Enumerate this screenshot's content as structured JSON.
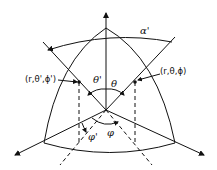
{
  "diagram": {
    "type": "spherical-coordinate-rotation",
    "labels": {
      "alpha": "α'",
      "point_primed": "(r,θ',ϕ')",
      "point": "(r,θ,ϕ)",
      "theta_primed": "θ'",
      "theta": "θ",
      "phi_primed": "φ'",
      "phi": "φ"
    },
    "colors": {
      "stroke": "#111111",
      "background": "#ffffff"
    }
  }
}
